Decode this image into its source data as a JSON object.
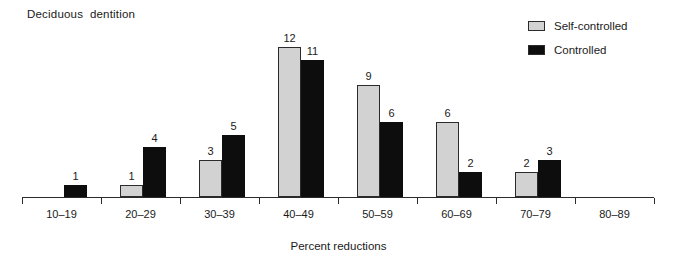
{
  "chart_data": {
    "type": "bar",
    "title": "Deciduous  dentition",
    "xlabel": "Percent reductions",
    "ylabel": "",
    "grid": false,
    "legend_position": "top-right",
    "ylim": [
      0,
      12
    ],
    "categories": [
      "10–19",
      "20–29",
      "30–39",
      "40–49",
      "50–59",
      "60–69",
      "70–79",
      "80–89"
    ],
    "series": [
      {
        "name": "Self-controlled",
        "color": "#d2d2d2",
        "values": [
          null,
          1,
          3,
          12,
          9,
          6,
          2,
          null
        ]
      },
      {
        "name": "Controlled",
        "color": "#0d0d0d",
        "values": [
          1,
          4,
          5,
          11,
          6,
          2,
          3,
          null
        ]
      }
    ]
  },
  "legend": {
    "items": [
      {
        "label": "Self-controlled",
        "swatch": "gray"
      },
      {
        "label": "Controlled",
        "swatch": "black"
      }
    ]
  }
}
